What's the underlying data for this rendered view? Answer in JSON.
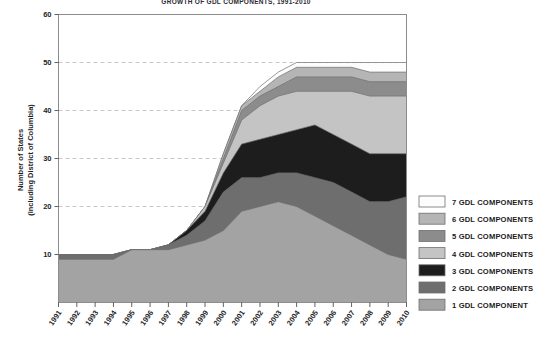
{
  "chart_data": {
    "type": "area",
    "title": "GROWTH OF GDL COMPONENTS, 1991-2010",
    "xlabel": "",
    "ylabel": "Number of States\n(including District of Columbia)",
    "ylabel_line1": "Number of States",
    "ylabel_line2": "(including District of Columbia)",
    "stacked": true,
    "grid": true,
    "legend_position": "right",
    "ylim": [
      0,
      60
    ],
    "yticks": [
      0,
      10,
      20,
      30,
      40,
      50,
      60
    ],
    "ytick_labels": [
      "0",
      "10",
      "20",
      "30",
      "40",
      "50",
      "60"
    ],
    "categories": [
      1991,
      1992,
      1993,
      1994,
      1995,
      1996,
      1997,
      1998,
      1999,
      2000,
      2001,
      2002,
      2003,
      2004,
      2005,
      2006,
      2007,
      2008,
      2009,
      2010
    ],
    "xtick_labels": [
      "1991",
      "1992",
      "1993",
      "1994",
      "1995",
      "1996",
      "1997",
      "1998",
      "1999",
      "2000",
      "2001",
      "2002",
      "2003",
      "2004",
      "2005",
      "2006",
      "2007",
      "2008",
      "2009",
      "2010"
    ],
    "series": [
      {
        "name": "1 GDL COMPONENT",
        "color": "#a3a3a3",
        "values": [
          9,
          9,
          9,
          9,
          11,
          11,
          11,
          12,
          13,
          15,
          19,
          20,
          21,
          20,
          18,
          16,
          14,
          12,
          10,
          9
        ]
      },
      {
        "name": "2 GDL COMPONENTS",
        "color": "#6e6e6e",
        "values": [
          1,
          1,
          1,
          1,
          0,
          0,
          1,
          2,
          4,
          8,
          7,
          6,
          6,
          7,
          8,
          9,
          9,
          9,
          11,
          13
        ]
      },
      {
        "name": "3 GDL COMPONENTS",
        "color": "#1d1d1d",
        "values": [
          0,
          0,
          0,
          0,
          0,
          0,
          0,
          1,
          2,
          4,
          7,
          8,
          8,
          9,
          11,
          10,
          10,
          10,
          10,
          9
        ]
      },
      {
        "name": "4 GDL COMPONENTS",
        "color": "#c4c4c4",
        "values": [
          0,
          0,
          0,
          0,
          0,
          0,
          0,
          0,
          1,
          2,
          5,
          7,
          8,
          8,
          7,
          9,
          11,
          12,
          12,
          12
        ]
      },
      {
        "name": "5 GDL COMPONENTS",
        "color": "#8c8c8c",
        "values": [
          0,
          0,
          0,
          0,
          0,
          0,
          0,
          0,
          0,
          1,
          2,
          2,
          2,
          3,
          3,
          3,
          3,
          3,
          3,
          3
        ]
      },
      {
        "name": "6 GDL COMPONENTS",
        "color": "#b5b5b5",
        "values": [
          0,
          0,
          0,
          0,
          0,
          0,
          0,
          0,
          0,
          1,
          1,
          1,
          2,
          2,
          2,
          2,
          2,
          2,
          2,
          2
        ]
      },
      {
        "name": "7 GDL COMPONENTS",
        "color": "#fdfdfd",
        "values": [
          0,
          0,
          0,
          0,
          0,
          0,
          0,
          0,
          0,
          0,
          0,
          1,
          1,
          1,
          1,
          1,
          1,
          2,
          2,
          2
        ]
      }
    ]
  },
  "legend": {
    "entries": [
      {
        "label": "7 GDL COMPONENTS",
        "color": "#fdfdfd"
      },
      {
        "label": "6 GDL COMPONENTS",
        "color": "#b5b5b5"
      },
      {
        "label": "5 GDL COMPONENTS",
        "color": "#8c8c8c"
      },
      {
        "label": "4 GDL COMPONENTS",
        "color": "#c4c4c4"
      },
      {
        "label": "3 GDL COMPONENTS",
        "color": "#1d1d1d"
      },
      {
        "label": "2 GDL COMPONENTS",
        "color": "#6e6e6e"
      },
      {
        "label": "1 GDL COMPONENT",
        "color": "#a3a3a3"
      }
    ]
  },
  "colors": {
    "background": "#ffffff",
    "frame": "#8d8d8d",
    "gridline": "#b9b9b9",
    "text": "#1f1f28"
  }
}
